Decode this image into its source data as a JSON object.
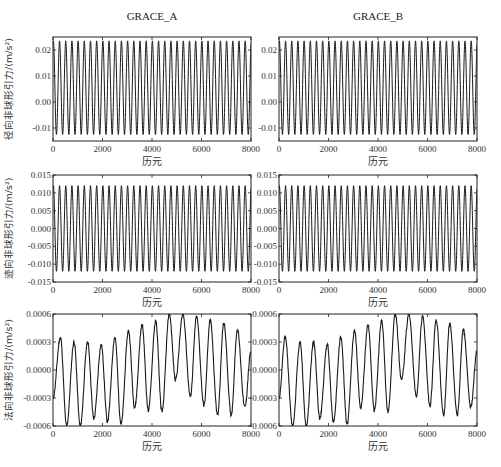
{
  "columns": [
    {
      "title": "GRACE_A"
    },
    {
      "title": "GRACE_B"
    }
  ],
  "chart_data": [
    {
      "type": "line",
      "id": "radial_A",
      "column": "GRACE_A",
      "row": 0,
      "title": "",
      "xlabel": "历元",
      "ylabel": "径向非球形引力/(m/s²)",
      "xlim": [
        0,
        8000
      ],
      "ylim": [
        -0.015,
        0.025
      ],
      "xticks": [
        0,
        2000,
        4000,
        6000,
        8000
      ],
      "yticks": [
        -0.01,
        0.0,
        0.01,
        0.02
      ],
      "ytick_labels": [
        "-0.01",
        "0.00",
        "0.01",
        "0.02"
      ],
      "series": [
        {
          "name": "radial",
          "shape": "sinusoid",
          "cycles": 32,
          "max": 0.0235,
          "min": -0.0125
        }
      ]
    },
    {
      "type": "line",
      "id": "radial_B",
      "column": "GRACE_B",
      "row": 0,
      "title": "",
      "xlabel": "历元",
      "ylabel": "",
      "xlim": [
        0,
        8000
      ],
      "ylim": [
        -0.015,
        0.025
      ],
      "xticks": [
        0,
        2000,
        4000,
        6000,
        8000
      ],
      "yticks": [
        -0.01,
        0.0,
        0.01,
        0.02
      ],
      "ytick_labels": [
        "-0.01",
        "0.00",
        "0.01",
        "0.02"
      ],
      "series": [
        {
          "name": "radial",
          "shape": "sinusoid",
          "cycles": 32,
          "max": 0.0235,
          "min": -0.0125
        }
      ]
    },
    {
      "type": "line",
      "id": "along_A",
      "column": "GRACE_A",
      "row": 1,
      "title": "",
      "xlabel": "历元",
      "ylabel": "迹向非球形引力/(m/s²)",
      "xlim": [
        0,
        8000
      ],
      "ylim": [
        -0.015,
        0.015
      ],
      "xticks": [
        0,
        2000,
        4000,
        6000,
        8000
      ],
      "yticks": [
        -0.015,
        -0.01,
        -0.005,
        0.0,
        0.005,
        0.01,
        0.015
      ],
      "ytick_labels": [
        "-0.015",
        "-0.010",
        "-0.005",
        "0.000",
        "0.005",
        "0.010",
        "0.015"
      ],
      "series": [
        {
          "name": "along-track",
          "shape": "sinusoid",
          "cycles": 32,
          "max": 0.012,
          "min": -0.012
        }
      ]
    },
    {
      "type": "line",
      "id": "along_B",
      "column": "GRACE_B",
      "row": 1,
      "title": "",
      "xlabel": "历元",
      "ylabel": "",
      "xlim": [
        0,
        8000
      ],
      "ylim": [
        -0.015,
        0.015
      ],
      "xticks": [
        0,
        2000,
        4000,
        6000,
        8000
      ],
      "yticks": [
        -0.015,
        -0.01,
        -0.005,
        0.0,
        0.005,
        0.01,
        0.015
      ],
      "ytick_labels": [
        "-0.015",
        "-0.010",
        "-0.005",
        "0.000",
        "0.005",
        "0.010",
        "0.015"
      ],
      "series": [
        {
          "name": "along-track",
          "shape": "sinusoid",
          "cycles": 32,
          "max": 0.012,
          "min": -0.012
        }
      ]
    },
    {
      "type": "line",
      "id": "normal_A",
      "column": "GRACE_A",
      "row": 2,
      "title": "",
      "xlabel": "历元",
      "ylabel": "法向非球形引力/(m/s²)",
      "xlim": [
        0,
        8000
      ],
      "ylim": [
        -0.0006,
        0.0006
      ],
      "xticks": [
        0,
        2000,
        4000,
        6000,
        8000
      ],
      "yticks": [
        -0.0006,
        -0.0003,
        0.0,
        0.0003,
        0.0006
      ],
      "ytick_labels": [
        "-0.0006",
        "-0.0003",
        "0.0000",
        "0.0003",
        "0.0006"
      ],
      "series": [
        {
          "name": "normal",
          "x": [
            0,
            300,
            550,
            850,
            1100,
            1400,
            1650,
            1950,
            2200,
            2500,
            2750,
            3050,
            3300,
            3600,
            3850,
            4150,
            4400,
            4700,
            4950,
            5250,
            5550,
            5800,
            6100,
            6350,
            6650,
            6900,
            7200,
            7450,
            7750,
            8000
          ],
          "y": [
            -0.0003,
            0.00035,
            -0.0006,
            0.0003,
            -0.0006,
            0.0003,
            -0.00052,
            0.00027,
            -0.00055,
            0.00035,
            -0.00058,
            0.00042,
            -0.0004,
            0.00048,
            -0.00043,
            0.00052,
            -0.00045,
            0.0006,
            -0.0001,
            0.0006,
            -0.00028,
            0.00057,
            -0.00038,
            0.00053,
            -0.00048,
            0.0005,
            -0.00048,
            0.00043,
            -0.0004,
            0.0002
          ]
        }
      ]
    },
    {
      "type": "line",
      "id": "normal_B",
      "column": "GRACE_B",
      "row": 2,
      "title": "",
      "xlabel": "历元",
      "ylabel": "",
      "xlim": [
        0,
        8000
      ],
      "ylim": [
        -0.0006,
        0.0006
      ],
      "xticks": [
        0,
        2000,
        4000,
        6000,
        8000
      ],
      "yticks": [
        -0.0006,
        -0.0003,
        0.0,
        0.0003,
        0.0006
      ],
      "ytick_labels": [
        "-0.0006",
        "-0.0003",
        "0.0000",
        "0.0003",
        "0.0006"
      ],
      "series": [
        {
          "name": "normal",
          "x": [
            0,
            250,
            550,
            850,
            1100,
            1400,
            1650,
            1950,
            2200,
            2500,
            2750,
            3050,
            3300,
            3600,
            3850,
            4150,
            4400,
            4700,
            4950,
            5250,
            5550,
            5800,
            6100,
            6350,
            6650,
            6900,
            7200,
            7450,
            7750,
            8000
          ],
          "y": [
            -0.0003,
            0.00035,
            -0.0006,
            0.0003,
            -0.0006,
            0.0003,
            -0.00052,
            0.00027,
            -0.00055,
            0.00035,
            -0.00058,
            0.00042,
            -0.0004,
            0.00048,
            -0.00043,
            0.00052,
            -0.00045,
            0.0006,
            -0.0001,
            0.0006,
            -0.00028,
            0.00057,
            -0.00038,
            0.00053,
            -0.00048,
            0.0005,
            -0.00048,
            0.00043,
            -0.0004,
            0.0002
          ]
        }
      ]
    }
  ]
}
